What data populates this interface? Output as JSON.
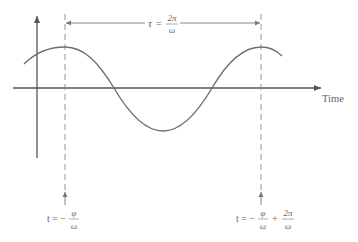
{
  "diagram": {
    "colors": {
      "axis": "#555555",
      "curve": "#6e6e6e",
      "dashed": "#8a8a8a",
      "text": "#666666",
      "background": "#ffffff"
    },
    "axes": {
      "x_label": "Time",
      "origin_x": 37,
      "origin_y": 88
    },
    "period_label": {
      "symbol": "τ",
      "equals": "=",
      "numerator": "2π",
      "denominator": "ω"
    },
    "markers": [
      {
        "x": 65,
        "label_t": "t",
        "label_eq": "= −",
        "frac1_num": "φ",
        "frac1_den": "ω"
      },
      {
        "x": 261,
        "label_t": "t",
        "label_eq": "= −",
        "frac1_num": "φ",
        "frac1_den": "ω",
        "plus": "+",
        "frac2_num": "2π",
        "frac2_den": "ω"
      }
    ],
    "curve": {
      "type": "cosine",
      "peak1_x": 65,
      "peak2_x": 261,
      "trough_x": 163,
      "peak_y": 47,
      "trough_y": 131,
      "start_x": 24,
      "end_x": 282
    }
  }
}
